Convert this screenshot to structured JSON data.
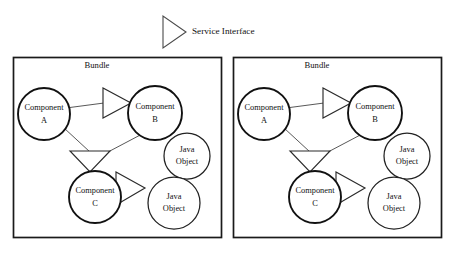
{
  "diagram": {
    "type": "component-diagram",
    "title": "",
    "legend": {
      "symbol_name": "service-interface-triangle",
      "label": "Service Interface"
    },
    "panels": [
      {
        "id": "bundle-left",
        "title": "Bundle",
        "nodes": [
          {
            "id": "comp-a",
            "kind": "component",
            "label_line1": "Component",
            "label_line2": "A"
          },
          {
            "id": "comp-b",
            "kind": "component",
            "label_line1": "Component",
            "label_line2": "B"
          },
          {
            "id": "comp-c",
            "kind": "component",
            "label_line1": "Component",
            "label_line2": "C"
          },
          {
            "id": "obj-1",
            "kind": "java-object",
            "label_line1": "Java",
            "label_line2": "Object"
          },
          {
            "id": "obj-2",
            "kind": "java-object",
            "label_line1": "Java",
            "label_line2": "Object"
          }
        ],
        "interfaces": [
          {
            "id": "iface-ab",
            "from": "comp-a",
            "to": "comp-b",
            "direction": "right"
          },
          {
            "id": "iface-ac",
            "from": "comp-a",
            "to": "comp-c",
            "direction": "down"
          },
          {
            "id": "iface-cobj",
            "from": "comp-c",
            "to": "obj-2",
            "direction": "right"
          }
        ]
      },
      {
        "id": "bundle-right",
        "title": "Bundle",
        "nodes": [
          {
            "id": "comp-a",
            "kind": "component",
            "label_line1": "Component",
            "label_line2": "A"
          },
          {
            "id": "comp-b",
            "kind": "component",
            "label_line1": "Component",
            "label_line2": "B"
          },
          {
            "id": "comp-c",
            "kind": "component",
            "label_line1": "Component",
            "label_line2": "C"
          },
          {
            "id": "obj-1",
            "kind": "java-object",
            "label_line1": "Java",
            "label_line2": "Object"
          },
          {
            "id": "obj-2",
            "kind": "java-object",
            "label_line1": "Java",
            "label_line2": "Object"
          }
        ],
        "interfaces": [
          {
            "id": "iface-ab",
            "from": "comp-a",
            "to": "comp-b",
            "direction": "right"
          },
          {
            "id": "iface-ac",
            "from": "comp-a",
            "to": "comp-c",
            "direction": "down"
          },
          {
            "id": "iface-cobj",
            "from": "comp-c",
            "to": "obj-2",
            "direction": "right"
          }
        ]
      }
    ],
    "colors": {
      "background": "#ffffff",
      "box_stroke": "#1a1a1a",
      "component_stroke": "#111111",
      "object_stroke": "#222222",
      "connector_stroke": "#3a3a3a",
      "text": "#111111"
    }
  }
}
